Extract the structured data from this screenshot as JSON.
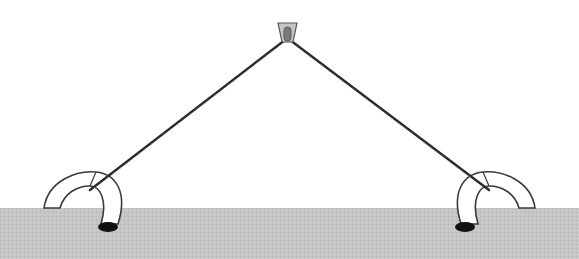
{
  "canvas": {
    "width": 579,
    "height": 259,
    "background": "#ffffff"
  },
  "colors": {
    "ground": "#c6c6c6",
    "ground_dot": "#b4b4b4",
    "rope": "#2a2a2a",
    "outline": "#3a3a3a",
    "anchor_fill": "#ffffff",
    "stake": "#111111",
    "clip_fill": "#bdbdbd",
    "clip_slot": "#7a7a7a"
  },
  "diagram": {
    "ground_top_y": 208,
    "apex": {
      "x": 287,
      "y": 40
    },
    "left_anchor": {
      "junction": {
        "x": 90,
        "y": 191
      },
      "stake": {
        "x": 108,
        "y": 226
      }
    },
    "right_anchor": {
      "junction": {
        "x": 489,
        "y": 191
      },
      "stake": {
        "x": 465,
        "y": 226
      }
    }
  }
}
